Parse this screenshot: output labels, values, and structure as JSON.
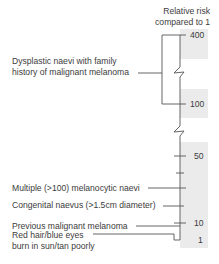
{
  "axis": {
    "title_line1": "Relative risk",
    "title_line2": "compared to 1",
    "tick_labels": [
      "400",
      "100",
      "50",
      "10",
      "1"
    ]
  },
  "factors": [
    {
      "label_lines": [
        "Dysplastic naevi with family",
        "history of malignant melanoma"
      ],
      "relative_risk_range": [
        100,
        400
      ]
    },
    {
      "label_lines": [
        "Multiple (>100) melanocytic naevi"
      ],
      "relative_risk": "~ between 10 and 50"
    },
    {
      "label_lines": [
        "Congenital naevus (>1.5cm diameter)"
      ],
      "relative_risk": "~ between 10 and 50"
    },
    {
      "label_lines": [
        "Previous malignant melanoma"
      ],
      "relative_risk": 10
    },
    {
      "label_lines": [
        "Red hair/blue eyes",
        "burn in sun/tan poorly"
      ],
      "relative_risk": "~ between 1 and 10"
    }
  ],
  "colors": {
    "band": "#ebebeb",
    "line": "#555555",
    "text": "#3c3c3c"
  }
}
